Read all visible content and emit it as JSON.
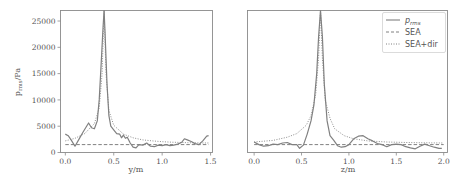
{
  "chart_data": [
    {
      "type": "line",
      "title": "",
      "xlabel": "y/m",
      "ylabel": "p_rms/Pa",
      "xlim": [
        -0.05,
        1.52
      ],
      "ylim": [
        0,
        27000
      ],
      "xticks": [
        "0.0",
        "0.5",
        "1.0",
        "1.5"
      ],
      "yticks": [
        "0",
        "5000",
        "10000",
        "15000",
        "20000",
        "25000"
      ],
      "grid": false,
      "series": [
        {
          "name": "p_rms",
          "style": "solid",
          "x": [
            0.0,
            0.03,
            0.06,
            0.1,
            0.14,
            0.18,
            0.22,
            0.24,
            0.27,
            0.3,
            0.33,
            0.35,
            0.37,
            0.39,
            0.4,
            0.41,
            0.43,
            0.45,
            0.47,
            0.5,
            0.53,
            0.56,
            0.58,
            0.6,
            0.62,
            0.64,
            0.67,
            0.7,
            0.73,
            0.76,
            0.8,
            0.84,
            0.88,
            0.92,
            0.96,
            1.0,
            1.04,
            1.08,
            1.12,
            1.16,
            1.2,
            1.23,
            1.26,
            1.3,
            1.34,
            1.38,
            1.42,
            1.46,
            1.48
          ],
          "y": [
            3500,
            3200,
            2400,
            1200,
            2500,
            3800,
            5000,
            5600,
            4700,
            4500,
            6000,
            10000,
            17000,
            24000,
            27000,
            23000,
            13000,
            7000,
            5000,
            4300,
            3600,
            3500,
            2800,
            3300,
            2700,
            2900,
            1800,
            1000,
            900,
            1500,
            1400,
            1800,
            1200,
            1100,
            1400,
            1300,
            1500,
            1300,
            1400,
            1600,
            1900,
            2600,
            2400,
            2100,
            1700,
            1500,
            2200,
            3100,
            3200
          ]
        },
        {
          "name": "SEA",
          "style": "dashed",
          "x": [
            0.0,
            1.48
          ],
          "y": [
            1500,
            1500
          ]
        },
        {
          "name": "SEA+dir",
          "style": "dotted",
          "x": [
            0.0,
            0.1,
            0.2,
            0.3,
            0.35,
            0.38,
            0.4,
            0.42,
            0.45,
            0.5,
            0.6,
            0.7,
            0.8,
            0.9,
            1.0,
            1.1,
            1.2,
            1.3,
            1.4,
            1.48
          ],
          "y": [
            2200,
            2700,
            3600,
            5500,
            8500,
            15000,
            27000,
            15000,
            8000,
            5200,
            3500,
            2800,
            2400,
            2200,
            2050,
            1950,
            1900,
            1850,
            1820,
            1800
          ]
        }
      ]
    },
    {
      "type": "line",
      "title": "",
      "xlabel": "z/m",
      "ylabel": "",
      "xlim": [
        -0.07,
        2.04
      ],
      "ylim": [
        0,
        27000
      ],
      "xticks": [
        "0.0",
        "0.5",
        "1.0",
        "1.5",
        "2.0"
      ],
      "yticks": [],
      "grid": false,
      "legend": {
        "position": "upper right",
        "entries": [
          "p_rms",
          "SEA",
          "SEA+dir"
        ]
      },
      "series": [
        {
          "name": "p_rms",
          "style": "solid",
          "x": [
            0.0,
            0.05,
            0.1,
            0.15,
            0.2,
            0.25,
            0.3,
            0.35,
            0.4,
            0.45,
            0.48,
            0.52,
            0.56,
            0.6,
            0.63,
            0.66,
            0.68,
            0.7,
            0.72,
            0.74,
            0.77,
            0.8,
            0.84,
            0.88,
            0.92,
            0.96,
            1.0,
            1.05,
            1.1,
            1.15,
            1.2,
            1.25,
            1.3,
            1.35,
            1.4,
            1.45,
            1.5,
            1.55,
            1.6,
            1.65,
            1.7,
            1.75,
            1.8,
            1.85,
            1.9,
            1.95,
            1.98
          ],
          "y": [
            2000,
            1500,
            1200,
            1300,
            1600,
            1500,
            1800,
            1900,
            1500,
            1500,
            800,
            1400,
            3500,
            6000,
            9000,
            15000,
            22000,
            27000,
            22000,
            13000,
            6000,
            3200,
            2300,
            1300,
            1000,
            1100,
            1500,
            2600,
            3100,
            3200,
            2600,
            2200,
            1700,
            1500,
            1100,
            1500,
            1600,
            1500,
            1100,
            900,
            700,
            1200,
            1600,
            1300,
            1000,
            800,
            800
          ]
        },
        {
          "name": "SEA",
          "style": "dashed",
          "x": [
            0.0,
            2.0
          ],
          "y": [
            1500,
            1500
          ]
        },
        {
          "name": "SEA+dir",
          "style": "dotted",
          "x": [
            0.0,
            0.2,
            0.35,
            0.45,
            0.55,
            0.6,
            0.65,
            0.68,
            0.7,
            0.72,
            0.75,
            0.8,
            0.85,
            0.95,
            1.05,
            1.2,
            1.4,
            1.6,
            1.8,
            2.0
          ],
          "y": [
            2000,
            2300,
            2900,
            3600,
            5200,
            7000,
            11000,
            18000,
            27000,
            18000,
            10000,
            6500,
            4500,
            3200,
            2600,
            2200,
            2000,
            1900,
            1850,
            1800
          ]
        }
      ]
    }
  ],
  "legend": {
    "entries": [
      {
        "label": "p_rms",
        "label_main": "p",
        "label_sub": "rms",
        "style": "solid"
      },
      {
        "label": "SEA",
        "style": "dashed"
      },
      {
        "label": "SEA+dir",
        "style": "dotted"
      }
    ]
  },
  "colors": {
    "line": "#808080",
    "axis": "#7a7a7a",
    "text": "#555555"
  }
}
